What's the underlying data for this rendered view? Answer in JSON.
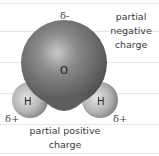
{
  "diagram": {
    "atoms": [
      {
        "id": "oxygen",
        "symbol": "O"
      },
      {
        "id": "hydrogen-left",
        "symbol": "H"
      },
      {
        "id": "hydrogen-right",
        "symbol": "H"
      }
    ],
    "charges": {
      "oxygen_delta": "δ-",
      "hydrogen_left_delta": "δ+",
      "hydrogen_right_delta": "δ+"
    },
    "labels": {
      "negative_line1": "partial",
      "negative_line2": "negative",
      "negative_line3": "charge",
      "positive_line1": "partial positive",
      "positive_line2": "charge"
    },
    "colors": {
      "oxygen": "#6e6e6e",
      "hydrogen": "#bdbdbd",
      "text": "#3a3a3a",
      "paper_line": "#e6e6e6"
    }
  }
}
